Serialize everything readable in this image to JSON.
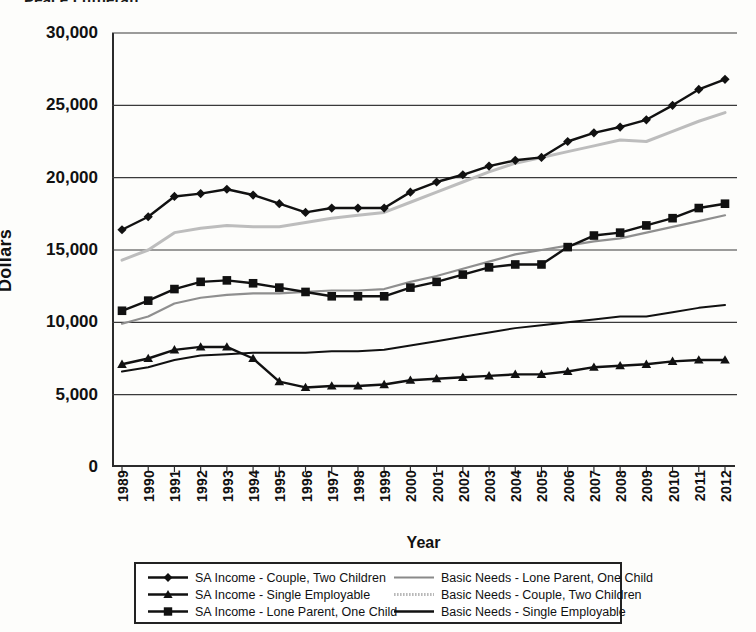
{
  "title_fragment": "Peace Lutheran …",
  "axes": {
    "y_title": "Dollars",
    "y_ticks": [
      "30,000",
      "25,000",
      "20,000",
      "15,000",
      "10,000",
      "5,000",
      "0"
    ],
    "x_title": "Year"
  },
  "legend": {
    "items": [
      {
        "label": "SA Income - Couple, Two Children",
        "marker": "diamond-marker",
        "color": "#111111",
        "column": "left"
      },
      {
        "label": "SA Income - Single Employable",
        "marker": "triangle-marker",
        "color": "#111111",
        "column": "left"
      },
      {
        "label": "SA Income - Lone Parent, One Child",
        "marker": "square-marker",
        "color": "#111111",
        "column": "left"
      },
      {
        "label": "Basic Needs - Lone Parent, One Child",
        "marker": "plain-line",
        "color": "#8a8a8a",
        "column": "right"
      },
      {
        "label": "Basic Needs - Couple, Two Children",
        "marker": "dotted-line",
        "color": "#b9b9b9",
        "column": "right"
      },
      {
        "label": "Basic Needs - Single Employable",
        "marker": "plain-line",
        "color": "#111111",
        "column": "right"
      }
    ]
  },
  "chart_data": {
    "type": "line",
    "title": "Peace Lutheran …",
    "xlabel": "Year",
    "ylabel": "Dollars",
    "ylim": [
      0,
      30000
    ],
    "ytick_step": 5000,
    "grid": "horizontal",
    "legend_position": "bottom",
    "categories": [
      "1989",
      "1990",
      "1991",
      "1992",
      "1993",
      "1994",
      "1995",
      "1996",
      "1997",
      "1998",
      "1999",
      "2000",
      "2001",
      "2002",
      "2003",
      "2004",
      "2005",
      "2006",
      "2007",
      "2008",
      "2009",
      "2010",
      "2011",
      "2012"
    ],
    "series": [
      {
        "name": "SA Income - Couple, Two Children",
        "marker": "diamond",
        "color": "#111111",
        "width": 2.4,
        "values": [
          16400,
          17300,
          18700,
          18900,
          19200,
          18800,
          18200,
          17600,
          17900,
          17900,
          17900,
          19000,
          19700,
          20200,
          20800,
          21200,
          21400,
          22500,
          23100,
          23500,
          24000,
          25000,
          26100,
          26800
        ]
      },
      {
        "name": "SA Income - Single Employable",
        "marker": "triangle",
        "color": "#111111",
        "width": 2.4,
        "values": [
          7100,
          7500,
          8100,
          8300,
          8300,
          7500,
          5900,
          5500,
          5600,
          5600,
          5700,
          6000,
          6100,
          6200,
          6300,
          6400,
          6400,
          6600,
          6900,
          7000,
          7100,
          7300,
          7400,
          7400
        ]
      },
      {
        "name": "SA Income - Lone Parent, One Child",
        "marker": "square",
        "color": "#111111",
        "width": 2.4,
        "values": [
          10800,
          11500,
          12300,
          12800,
          12900,
          12700,
          12400,
          12100,
          11800,
          11800,
          11800,
          12400,
          12800,
          13300,
          13800,
          14000,
          14000,
          15200,
          16000,
          16200,
          16700,
          17200,
          17900,
          18200
        ]
      },
      {
        "name": "Basic Needs - Lone Parent, One Child",
        "marker": "none",
        "color": "#8f8f8f",
        "width": 2.2,
        "values": [
          9900,
          10400,
          11300,
          11700,
          11900,
          12000,
          12000,
          12100,
          12200,
          12200,
          12300,
          12800,
          13200,
          13700,
          14200,
          14700,
          15000,
          15300,
          15600,
          15800,
          16200,
          16600,
          17000,
          17400
        ]
      },
      {
        "name": "Basic Needs - Couple, Two Children",
        "marker": "none",
        "color": "#bdbdbd",
        "width": 3.0,
        "values": [
          14300,
          15000,
          16200,
          16500,
          16700,
          16600,
          16600,
          16900,
          17200,
          17400,
          17600,
          18300,
          19000,
          19700,
          20400,
          21000,
          21400,
          21800,
          22200,
          22600,
          22500,
          23200,
          23900,
          24500
        ]
      },
      {
        "name": "Basic Needs - Single Employable",
        "marker": "none",
        "color": "#111111",
        "width": 2.0,
        "values": [
          6600,
          6900,
          7400,
          7700,
          7800,
          7900,
          7900,
          7900,
          8000,
          8000,
          8100,
          8400,
          8700,
          9000,
          9300,
          9600,
          9800,
          10000,
          10200,
          10400,
          10400,
          10700,
          11000,
          11200
        ]
      }
    ]
  }
}
